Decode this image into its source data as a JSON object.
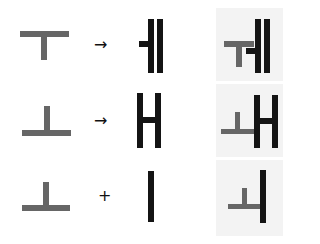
{
  "figure": {
    "colors": {
      "component": "#666666",
      "base": "#141414",
      "panel_bg": "#f3f3f3",
      "background": "#ffffff"
    },
    "rows": [
      {
        "component": "ㅜ-like T stroke",
        "operator": "→",
        "base_glyph": "ㅔ strokes",
        "result": "combined T + ㅔ"
      },
      {
        "component": "ㅗ-like ⊥ stroke",
        "operator": "→",
        "base_glyph": "H strokes",
        "result": "combined ⊥ + H"
      },
      {
        "component": "ㅗ-like ⊥ stroke",
        "operator": "+",
        "base_glyph": "ㅣ vertical stroke",
        "result": "combined ⊥ + ㅣ"
      }
    ]
  }
}
